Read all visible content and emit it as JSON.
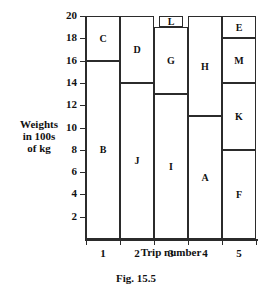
{
  "caption": "Fig. 15.5",
  "chart_data": {
    "type": "bar",
    "subtype": "stacked-bar",
    "title": "",
    "xlabel": "Trip number",
    "ylabel_lines": [
      "Weights",
      "in 100s",
      "of kg"
    ],
    "ylabel": "Weights in 100s of kg",
    "categories": [
      "1",
      "2",
      "3",
      "4",
      "5"
    ],
    "ylim": [
      0,
      20
    ],
    "ytick_labels": [
      "2",
      "4",
      "6",
      "8",
      "10",
      "12",
      "14",
      "16",
      "18",
      "20"
    ],
    "ytick_values": [
      2,
      4,
      6,
      8,
      10,
      12,
      14,
      16,
      18,
      20
    ],
    "ytick_step": 2,
    "grid": false,
    "legend": "none",
    "bar_outline_color": "#2b2b2b",
    "bar_fill_color": "#ffffff",
    "bars": [
      {
        "category": "1",
        "segments": [
          {
            "label": "B",
            "start": 0,
            "end": 16,
            "value": 16,
            "inset": false
          },
          {
            "label": "C",
            "start": 16,
            "end": 20,
            "value": 4,
            "inset": false
          }
        ]
      },
      {
        "category": "2",
        "segments": [
          {
            "label": "J",
            "start": 0,
            "end": 14,
            "value": 14,
            "inset": false
          },
          {
            "label": "D",
            "start": 14,
            "end": 20,
            "value": 6,
            "inset": false
          }
        ]
      },
      {
        "category": "3",
        "segments": [
          {
            "label": "I",
            "start": 0,
            "end": 13,
            "value": 13,
            "inset": false
          },
          {
            "label": "G",
            "start": 13,
            "end": 19,
            "value": 6,
            "inset": false
          },
          {
            "label": "L",
            "start": 19,
            "end": 20,
            "value": 1,
            "inset": true
          }
        ]
      },
      {
        "category": "4",
        "segments": [
          {
            "label": "A",
            "start": 0,
            "end": 11,
            "value": 11,
            "inset": false
          },
          {
            "label": "H",
            "start": 11,
            "end": 20,
            "value": 9,
            "inset": false
          }
        ]
      },
      {
        "category": "5",
        "segments": [
          {
            "label": "F",
            "start": 0,
            "end": 8,
            "value": 8,
            "inset": false
          },
          {
            "label": "K",
            "start": 8,
            "end": 14,
            "value": 6,
            "inset": false
          },
          {
            "label": "M",
            "start": 14,
            "end": 18,
            "value": 4,
            "inset": false
          },
          {
            "label": "E",
            "start": 18,
            "end": 20,
            "value": 2,
            "inset": false
          }
        ]
      }
    ]
  }
}
